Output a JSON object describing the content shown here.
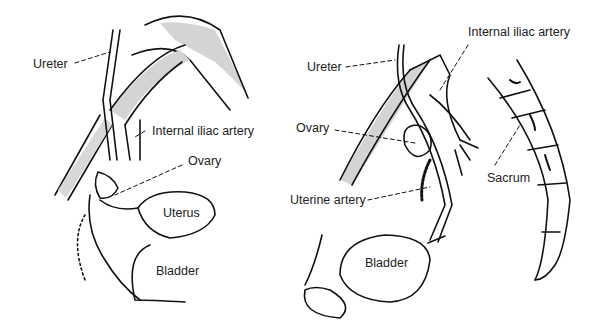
{
  "left_panel": {
    "labels": {
      "ureter": "Ureter",
      "internal_iliac_artery": "Internal iliac artery",
      "ovary": "Ovary",
      "uterus": "Uterus",
      "bladder": "Bladder"
    }
  },
  "right_panel": {
    "labels": {
      "ureter": "Ureter",
      "internal_iliac_artery": "Internal iliac artery",
      "ovary": "Ovary",
      "uterine_artery": "Uterine artery",
      "sacrum": "Sacrum",
      "bladder": "Bladder"
    }
  },
  "colors": {
    "line": "#111111",
    "shade": "#d4d4d4",
    "text": "#222222"
  }
}
